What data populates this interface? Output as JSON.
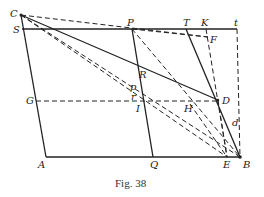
{
  "figure": {
    "caption": "Fig. 38",
    "points": {
      "C": {
        "label": "C",
        "x": 21,
        "y": 15
      },
      "S": {
        "label": "S",
        "x": 22,
        "y": 29
      },
      "P": {
        "label": "P",
        "x": 132,
        "y": 29
      },
      "T": {
        "label": "T",
        "x": 186,
        "y": 29
      },
      "K": {
        "label": "K",
        "x": 206,
        "y": 29
      },
      "t": {
        "label": "t",
        "x": 237,
        "y": 29
      },
      "F": {
        "label": "F",
        "x": 208,
        "y": 37
      },
      "R": {
        "label": "R",
        "x": 136,
        "y": 79
      },
      "p": {
        "label": "p",
        "x": 137,
        "y": 91
      },
      "r": {
        "label": "r",
        "x": 138,
        "y": 101
      },
      "G": {
        "label": "G",
        "x": 36,
        "y": 101
      },
      "I": {
        "label": "I",
        "x": 140,
        "y": 101
      },
      "H": {
        "label": "H",
        "x": 190,
        "y": 101
      },
      "D": {
        "label": "D",
        "x": 218,
        "y": 100
      },
      "d": {
        "label": "d",
        "x": 231,
        "y": 128
      },
      "A": {
        "label": "A",
        "x": 46,
        "y": 157
      },
      "Q": {
        "label": "Q",
        "x": 153,
        "y": 157
      },
      "E": {
        "label": "E",
        "x": 227,
        "y": 157
      },
      "B": {
        "label": "B",
        "x": 240,
        "y": 157
      }
    },
    "labels": [
      "C",
      "S",
      "P",
      "T",
      "K",
      "t",
      "F",
      "R",
      "p",
      "r",
      "G",
      "I",
      "H",
      "D",
      "d",
      "A",
      "Q",
      "E",
      "B"
    ],
    "solid_lines": [
      "C-A",
      "S-t",
      "A-B",
      "C-D",
      "P-Q",
      "T-B"
    ],
    "dashed_lines": [
      "C-F",
      "P-F",
      "K-E",
      "t-B",
      "G-D",
      "P-B",
      "C-B",
      "C-E",
      "D-E",
      "H-E"
    ]
  }
}
